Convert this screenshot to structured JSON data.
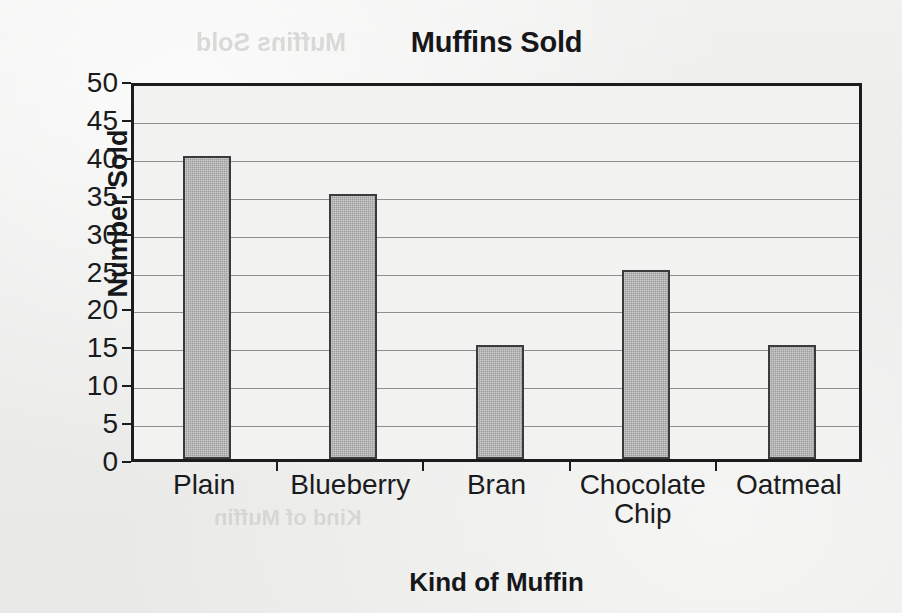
{
  "chart_data": {
    "type": "bar",
    "title": "Muffins Sold",
    "xlabel": "Kind of Muffin",
    "ylabel": "Number Sold",
    "categories": [
      "Plain",
      "Blueberry",
      "Bran",
      "Chocolate\nChip",
      "Oatmeal"
    ],
    "values": [
      40,
      35,
      15,
      25,
      15
    ],
    "ylim": [
      0,
      50
    ],
    "ytick_step": 5,
    "ytick_labels": [
      "50",
      "45",
      "40",
      "35",
      "30",
      "25",
      "20",
      "15",
      "10",
      "5",
      "0"
    ],
    "grid": true,
    "legend": null,
    "series": [
      {
        "name": "Muffins Sold",
        "values": [
          40,
          35,
          15,
          25,
          15
        ]
      }
    ],
    "colors": {
      "bar_fill": "#9d9d9d",
      "bar_edge": "#3a3b3d",
      "axis": "#1b1c1e",
      "gridline": "#8e8f91",
      "plot_background": "#f2f2f0",
      "page_background": "#ececeb",
      "text": "#16171a"
    }
  },
  "artifacts": {
    "bleed_top": "Muffins Sold",
    "bleed_mid": "Kind of Muffin"
  }
}
